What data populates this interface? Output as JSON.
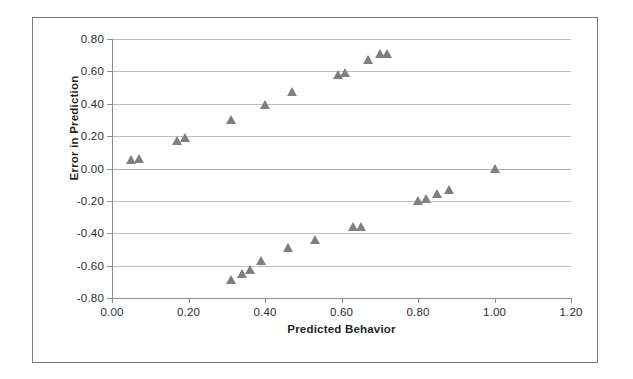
{
  "chart_data": {
    "type": "scatter",
    "title": "",
    "xlabel": "Predicted Behavior",
    "ylabel": "Error in Prediction",
    "xlim": [
      0.0,
      1.2
    ],
    "ylim": [
      -0.8,
      0.8
    ],
    "xticks": [
      "0.00",
      "0.20",
      "0.40",
      "0.60",
      "0.80",
      "1.00",
      "1.20"
    ],
    "xtick_values": [
      0.0,
      0.2,
      0.4,
      0.6,
      0.8,
      1.0,
      1.2
    ],
    "yticks": [
      "0.80",
      "0.60",
      "0.40",
      "0.20",
      "0.00",
      "-0.20",
      "-0.40",
      "-0.60",
      "-0.80"
    ],
    "ytick_values": [
      0.8,
      0.6,
      0.4,
      0.2,
      0.0,
      -0.2,
      -0.4,
      -0.6,
      -0.8
    ],
    "grid": "horizontal",
    "legend": "none",
    "marker": "triangle-up",
    "marker_color": "#7f7f7f",
    "series": [
      {
        "name": "Error in Prediction",
        "points": [
          [
            0.05,
            0.05
          ],
          [
            0.07,
            0.06
          ],
          [
            0.17,
            0.17
          ],
          [
            0.19,
            0.19
          ],
          [
            0.31,
            0.3
          ],
          [
            0.4,
            0.39
          ],
          [
            0.47,
            0.47
          ],
          [
            0.59,
            0.58
          ],
          [
            0.61,
            0.59
          ],
          [
            0.67,
            0.67
          ],
          [
            0.7,
            0.71
          ],
          [
            0.72,
            0.71
          ],
          [
            0.31,
            -0.69
          ],
          [
            0.34,
            -0.65
          ],
          [
            0.36,
            -0.63
          ],
          [
            0.39,
            -0.57
          ],
          [
            0.46,
            -0.49
          ],
          [
            0.53,
            -0.44
          ],
          [
            0.63,
            -0.36
          ],
          [
            0.65,
            -0.36
          ],
          [
            0.8,
            -0.2
          ],
          [
            0.82,
            -0.19
          ],
          [
            0.85,
            -0.16
          ],
          [
            0.88,
            -0.13
          ],
          [
            1.0,
            0.0
          ]
        ]
      }
    ]
  },
  "axes": {
    "x_title": "Predicted Behavior",
    "y_title": "Error in Prediction"
  },
  "colors": {
    "marker": "#7f7f7f",
    "gridline": "#bfbfbf",
    "axis": "#8c8c8c",
    "frame": "#7a7a7a",
    "background": "#ffffff",
    "tick_text": "#2b2b2b"
  }
}
